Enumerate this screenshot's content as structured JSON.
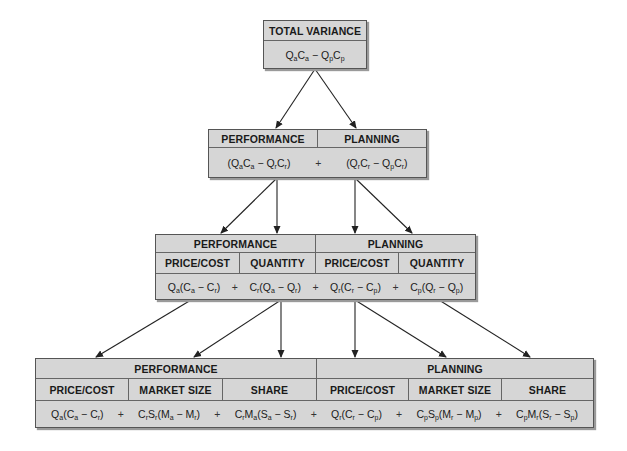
{
  "level1": {
    "header": "TOTAL VARIANCE",
    "formula": "QaCa − QpCp"
  },
  "level2": {
    "headers": [
      "PERFORMANCE",
      "PLANNING"
    ],
    "formulas": [
      "(QaCa − QrCr)",
      "+",
      "(QrCr − QpCr)"
    ]
  },
  "level3": {
    "groups": [
      "PERFORMANCE",
      "PLANNING"
    ],
    "subheaders": [
      "PRICE/COST",
      "QUANTITY",
      "PRICE/COST",
      "QUANTITY"
    ],
    "formulas": [
      "Qa(Ca − Cr)",
      "+",
      "Cr(Qa − Qr)",
      "+",
      "Qr(Cr − Cp)",
      "+",
      "Cp(Qr − Qp)"
    ]
  },
  "level4": {
    "groups": [
      "PERFORMANCE",
      "PLANNING"
    ],
    "subheaders": [
      "PRICE/COST",
      "MARKET SIZE",
      "SHARE",
      "PRICE/COST",
      "MARKET SIZE",
      "SHARE"
    ],
    "formulas": [
      "Qa(Ca − Cr)",
      "+",
      "CrSr(Ma − Mr)",
      "+",
      "CrMa(Sa − Sr)",
      "+",
      "Qr(Cr − Cp)",
      "+",
      "CpSp(Mr − Mp)",
      "+",
      "CpMr(Sr − Sp)"
    ]
  },
  "colors": {
    "box_fill": "#d6d6d6",
    "border": "#555555",
    "arrow": "#222222"
  }
}
